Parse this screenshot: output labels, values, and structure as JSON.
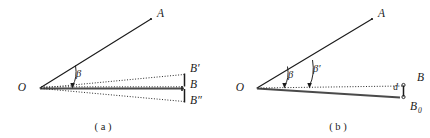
{
  "figure": {
    "name": "angular-deviation-diagram",
    "background": "#ffffff",
    "ink": "#1b1b1b",
    "width": 430,
    "height": 138,
    "panels": [
      {
        "id": "a",
        "caption": "( a )",
        "caption_x": 103,
        "caption_y": 130,
        "vertex": {
          "label": "O",
          "x": 22,
          "y": 91,
          "px": 40,
          "py": 88
        },
        "ray_a": {
          "label": "A",
          "x": 157,
          "y": 17,
          "tip_x": 150,
          "tip_y": 19
        },
        "angle": {
          "label": "β",
          "x": 76,
          "y": 77
        },
        "points": [
          {
            "label": "B′",
            "x": 190,
            "y": 72,
            "kind": "upper"
          },
          {
            "label": "B",
            "x": 190,
            "y": 88,
            "kind": "middle"
          },
          {
            "label": "B″",
            "x": 190,
            "y": 104,
            "kind": "lower"
          }
        ]
      },
      {
        "id": "b",
        "caption": "( b )",
        "caption_x": 338,
        "caption_y": 130,
        "vertex": {
          "label": "O",
          "x": 240,
          "y": 91,
          "px": 257,
          "py": 88
        },
        "ray_a": {
          "label": "A",
          "x": 378,
          "y": 17,
          "tip_x": 371,
          "tip_y": 19
        },
        "angles": [
          {
            "label": "β",
            "x": 288,
            "y": 78
          },
          {
            "label": "β′",
            "x": 313,
            "y": 72
          }
        ],
        "gap": {
          "label": "d",
          "x": 398,
          "y": 90
        },
        "points": [
          {
            "label": "B",
            "x": 417,
            "y": 81,
            "kind": "upper"
          },
          {
            "label": "B",
            "sub": "0",
            "x": 410,
            "y": 110,
            "kind": "lower"
          }
        ]
      }
    ]
  }
}
